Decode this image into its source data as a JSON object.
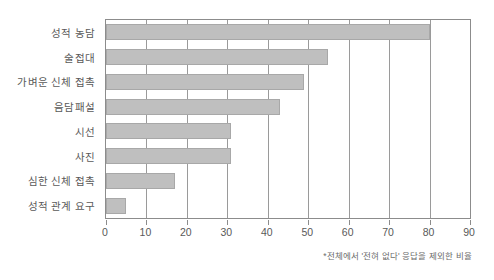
{
  "chart_data": {
    "type": "bar",
    "orientation": "horizontal",
    "title": "",
    "xlabel": "",
    "ylabel": "",
    "categories": [
      "성적 농담",
      "술접대",
      "가벼운 신체 접촉",
      "음담패설",
      "시선",
      "사진",
      "심한 신체 접촉",
      "성적 관계 요구"
    ],
    "values": [
      80,
      55,
      49,
      43,
      31,
      31,
      17,
      5
    ],
    "xlim": [
      0,
      90
    ],
    "xticks": [
      0,
      10,
      20,
      30,
      40,
      50,
      60,
      70,
      80,
      90
    ],
    "xtick_labels": [
      "0",
      "10",
      "20",
      "30",
      "40",
      "50",
      "60",
      "70",
      "80",
      "90"
    ],
    "grid": true,
    "legend": false,
    "annotation": "*전체에서 '전혀 없다' 응답을 제외한 비율",
    "bar_color": "#bfbfbf",
    "bar_border_color": "#a8a8a8",
    "axis_color": "#8c8c8c",
    "grid_color": "#9a9a9a",
    "text_color": "#595959",
    "background": "#ffffff"
  }
}
